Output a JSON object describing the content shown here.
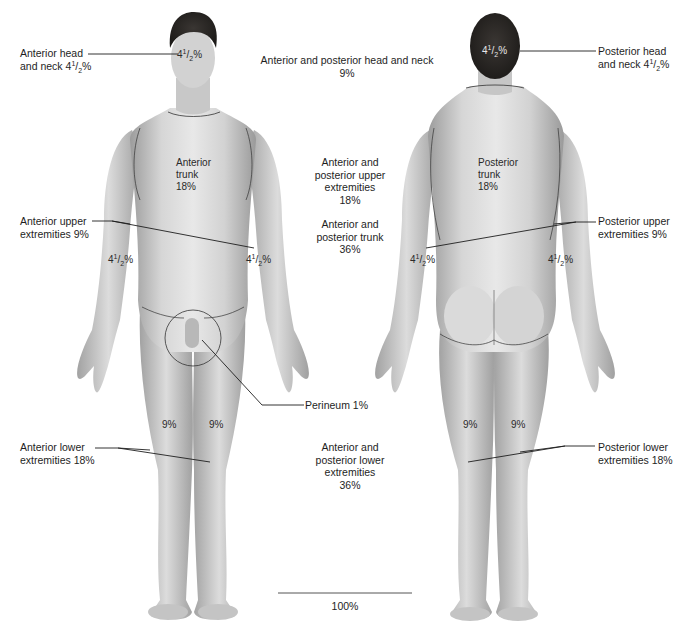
{
  "diagram": {
    "views": [
      "anterior",
      "posterior"
    ]
  },
  "labels": {
    "anterior_head": {
      "line1": "Anterior head",
      "line2_prefix": "and neck 4",
      "sup": "1",
      "sub": "2",
      "suffix": "%"
    },
    "center_head": {
      "line1": "Anterior and posterior head and neck",
      "line2": "9%"
    },
    "posterior_head": {
      "line1": "Posterior head",
      "line2_prefix": "and neck 4",
      "sup": "1",
      "sub": "2",
      "suffix": "%"
    },
    "anterior_trunk": {
      "line1": "Anterior",
      "line2": "trunk",
      "line3": "18%"
    },
    "posterior_trunk": {
      "line1": "Posterior",
      "line2": "trunk",
      "line3": "18%"
    },
    "center_upper": {
      "line1": "Anterior and",
      "line2": "posterior upper",
      "line3": "extremities",
      "line4": "18%"
    },
    "center_trunk": {
      "line1": "Anterior and",
      "line2": "posterior trunk",
      "line3": "36%"
    },
    "anterior_upper": {
      "line1": "Anterior upper",
      "line2": "extremities 9%"
    },
    "posterior_upper": {
      "line1": "Posterior upper",
      "line2": "extremities 9%"
    },
    "perineum": {
      "text": "Perineum 1%"
    },
    "anterior_lower": {
      "line1": "Anterior lower",
      "line2": "extremities 18%"
    },
    "posterior_lower": {
      "line1": "Posterior lower",
      "line2": "extremities 18%"
    },
    "center_lower": {
      "line1": "Anterior and",
      "line2": "posterior lower",
      "line3": "extremities",
      "line4": "36%"
    },
    "total": {
      "text": "100%"
    }
  },
  "body_values": {
    "half": {
      "whole": "4",
      "sup": "1",
      "sub": "2",
      "suffix": "%"
    },
    "leg": "9%"
  },
  "colors": {
    "skin_light": "#e4e4e4",
    "skin_mid": "#c4c4c4",
    "skin_dark": "#9a9a9a",
    "hair": "#2b2826",
    "line": "#1e1e1e"
  }
}
